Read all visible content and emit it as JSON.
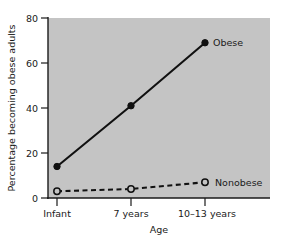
{
  "chart_data": {
    "type": "line",
    "title": "",
    "subtitle": "",
    "xlabel": "Age",
    "ylabel": "Percentage becoming obese adults",
    "categories": [
      "Infant",
      "7 years",
      "10–13 years"
    ],
    "xtick_labels": [
      "Infant",
      "7 years",
      "10–13 years"
    ],
    "ytick_labels": [
      "0",
      "20",
      "40",
      "60",
      "80"
    ],
    "yticks": [
      0,
      20,
      40,
      60,
      80
    ],
    "ylim": [
      0,
      80
    ],
    "grid": false,
    "legend_position": "inline-right-of-last-point",
    "plot_background": "#c4c4c4",
    "axis_color": "#1a1a1a",
    "series": [
      {
        "name": "Obese",
        "label": "Obese",
        "values": [
          14,
          41,
          69
        ],
        "line_style": "solid",
        "marker": "filled-circle",
        "color": "#111111"
      },
      {
        "name": "Nonobese",
        "label": "Nonobese",
        "values": [
          3,
          4,
          7
        ],
        "line_style": "dashed",
        "marker": "open-circle",
        "color": "#111111"
      }
    ]
  },
  "figure": {
    "caption": ""
  }
}
